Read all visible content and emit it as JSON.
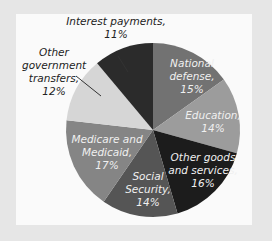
{
  "chart_data": {
    "type": "pie",
    "title": "",
    "start_angle": "12 o'clock",
    "direction": "clockwise",
    "slices": [
      {
        "label": "National defense",
        "value": 15,
        "text": [
          "National",
          "defense,",
          "15%"
        ],
        "color": "#727272"
      },
      {
        "label": "Education",
        "value": 14,
        "text": [
          "Education,",
          "14%"
        ],
        "color": "#9c9c9c"
      },
      {
        "label": "Other goods and services",
        "value": 16,
        "text": [
          "Other goods",
          "and services,",
          "16%"
        ],
        "color": "#1c1c1c"
      },
      {
        "label": "Social Security",
        "value": 14,
        "text": [
          "Social",
          "Security,",
          "14%"
        ],
        "color": "#555555"
      },
      {
        "label": "Medicare and Medicaid",
        "value": 17,
        "text": [
          "Medicare and",
          "Medicaid,",
          "17%"
        ],
        "color": "#858585"
      },
      {
        "label": "Other government transfers",
        "value": 12,
        "text": [
          "Other",
          "government",
          "transfers,",
          "12%"
        ],
        "color": "#d6d6d6"
      },
      {
        "label": "Interest payments",
        "value": 11,
        "text": [
          "Interest payments,",
          "11%"
        ],
        "color": "#2b2b2b"
      }
    ]
  }
}
